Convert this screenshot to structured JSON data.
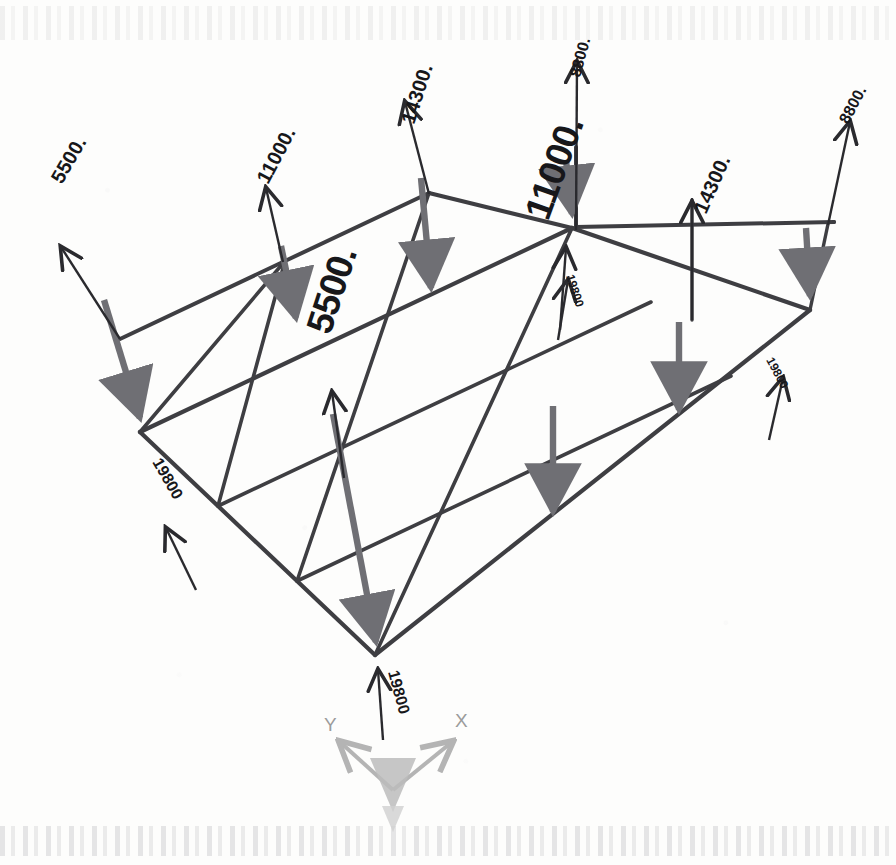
{
  "document": {
    "kind": "engineering-load-diagram",
    "description": "Isometric line drawing of a rectangular grillage / floor-beam frame with nodal load arrows and force magnitude labels."
  },
  "axes": {
    "x_label": "X",
    "y_label": "Y",
    "origin_marker": "z-axis-cone"
  },
  "load_labels": [
    {
      "id": "l1",
      "value": "5500.",
      "x": 62,
      "y": 185,
      "rotation": -60,
      "size": "mid",
      "direction": "up",
      "name": "load-label-5500-left"
    },
    {
      "id": "l2",
      "value": "11000.",
      "x": 268,
      "y": 185,
      "rotation": -62,
      "size": "mid",
      "direction": "up",
      "name": "load-label-11000-topleft"
    },
    {
      "id": "l3",
      "value": "14300.",
      "x": 414,
      "y": 125,
      "rotation": -72,
      "size": "mid",
      "direction": "up",
      "name": "load-label-14300-top"
    },
    {
      "id": "l4",
      "value": "8800.",
      "x": 580,
      "y": 78,
      "rotation": -75,
      "size": "sm",
      "direction": "up",
      "name": "load-label-8800-topcenter"
    },
    {
      "id": "l5",
      "value": "8800.",
      "x": 848,
      "y": 125,
      "rotation": -62,
      "size": "sm",
      "direction": "up",
      "name": "load-label-8800-topright"
    },
    {
      "id": "l6",
      "value": "14300.",
      "x": 706,
      "y": 215,
      "rotation": -66,
      "size": "mid",
      "direction": "up",
      "name": "load-label-14300-right"
    },
    {
      "id": "l7",
      "value": "11000.",
      "x": 548,
      "y": 222,
      "rotation": -70,
      "size": "big",
      "direction": "up",
      "name": "load-label-11000-center"
    },
    {
      "id": "l8",
      "value": "5500.",
      "x": 330,
      "y": 336,
      "rotation": -72,
      "size": "big",
      "direction": "up",
      "name": "load-label-5500-center"
    },
    {
      "id": "l9",
      "value": "19800",
      "x": 152,
      "y": 462,
      "rotation": 60,
      "size": "sm",
      "direction": "up",
      "name": "load-label-19800-left"
    },
    {
      "id": "l10",
      "value": "19800",
      "x": 388,
      "y": 672,
      "rotation": 75,
      "size": "sm",
      "direction": "up",
      "name": "load-label-19800-bottom"
    },
    {
      "id": "l11",
      "value": "19800",
      "x": 766,
      "y": 360,
      "rotation": 62,
      "size": "xs",
      "direction": "up",
      "name": "load-label-19800-right"
    },
    {
      "id": "l12",
      "value": "19800",
      "x": 566,
      "y": 276,
      "rotation": 72,
      "size": "xs",
      "direction": "up",
      "name": "load-label-19800-center"
    }
  ],
  "colors": {
    "structure_line": "#3e3e42",
    "reaction_arrow": "#6f6f74",
    "load_arrow": "#2a2a2e",
    "text": "#17171a",
    "axis_gray": "#9b9b9b",
    "paper": "#fdfdfc"
  },
  "chart_data": {
    "type": "diagram",
    "view": "isometric",
    "frame_nodes": {
      "left_corner": [
        140,
        432
      ],
      "top_corner": [
        572,
        228
      ],
      "right_corner": [
        810,
        310
      ],
      "bottom_corner": [
        375,
        655
      ]
    },
    "grid": {
      "spans_along_x": 3,
      "spans_along_y": 2
    },
    "forces_kN": {
      "upward_point_loads": [
        5500,
        11000,
        14300,
        8800,
        8800,
        14300,
        11000,
        5500
      ],
      "corner_reactions": [
        19800,
        19800,
        19800,
        19800
      ]
    },
    "units_note": "values as printed on drawing"
  }
}
